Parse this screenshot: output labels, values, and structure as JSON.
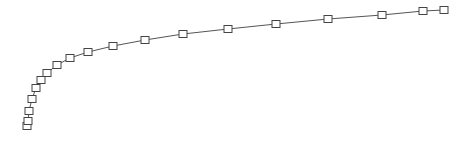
{
  "chart_data": {
    "type": "line",
    "title": "",
    "xlabel": "",
    "ylabel": "",
    "grid": false,
    "legend": [],
    "marker": "square",
    "colors": {
      "line": "#555555",
      "marker_stroke": "#444444",
      "marker_fill": "#ffffff",
      "background": "#ffffff"
    },
    "points_px": [
      [
        27,
        126
      ],
      [
        28,
        121
      ],
      [
        29,
        111
      ],
      [
        32,
        99
      ],
      [
        36,
        88
      ],
      [
        41,
        80
      ],
      [
        47,
        73
      ],
      [
        57,
        65
      ],
      [
        70,
        58
      ],
      [
        88,
        52
      ],
      [
        113,
        46
      ],
      [
        145,
        40
      ],
      [
        183,
        34
      ],
      [
        228,
        29
      ],
      [
        276,
        24
      ],
      [
        328,
        19
      ],
      [
        382,
        15
      ],
      [
        423,
        11
      ],
      [
        444,
        10
      ]
    ]
  }
}
